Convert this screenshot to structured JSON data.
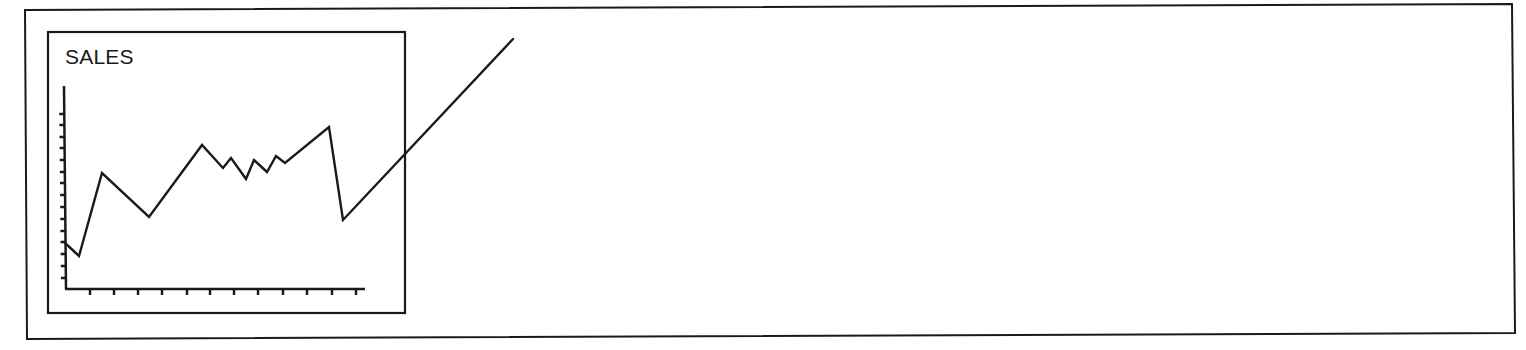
{
  "illustration": {
    "colors": {
      "ink": "#1a1a1a",
      "background": "#ffffff"
    },
    "outer_frame": {
      "corners": [
        [
          25,
          10
        ],
        [
          1512,
          4
        ],
        [
          1515,
          333
        ],
        [
          27,
          339
        ]
      ]
    },
    "inner_panel": {
      "x": 48,
      "y": 32,
      "x2": 405,
      "y2": 313
    },
    "axes": {
      "origin": [
        66,
        289
      ],
      "y_axis_top": [
        64,
        86
      ],
      "x_axis_end": [
        365,
        289
      ],
      "y_ticks_px": [
        114,
        125,
        137,
        148,
        160,
        172,
        183,
        195,
        207,
        219,
        231,
        242,
        254,
        266,
        278
      ],
      "x_ticks_px": [
        90,
        114,
        138,
        162,
        187,
        210,
        234,
        258,
        283,
        307,
        332,
        356
      ]
    },
    "line_points_px": [
      [
        65,
        243
      ],
      [
        79,
        256
      ],
      [
        102,
        173
      ],
      [
        149,
        217
      ],
      [
        202,
        145
      ],
      [
        223,
        168
      ],
      [
        231,
        158
      ],
      [
        246,
        179
      ],
      [
        254,
        160
      ],
      [
        267,
        172
      ],
      [
        276,
        156
      ],
      [
        285,
        163
      ],
      [
        329,
        127
      ],
      [
        343,
        220
      ],
      [
        513,
        39
      ]
    ]
  },
  "chart_data": {
    "type": "line",
    "title": "SALES",
    "xlabel": "",
    "ylabel": "",
    "x": [
      0,
      1,
      2,
      3,
      4,
      5,
      6,
      7,
      8,
      9,
      10,
      11,
      12,
      13,
      14
    ],
    "series": [
      {
        "name": "Sales",
        "values": [
          3.9,
          2.8,
          9.9,
          6.2,
          12.3,
          10.3,
          11.2,
          9.4,
          11.0,
          10.0,
          11.4,
          10.8,
          13.8,
          5.9,
          21.4
        ]
      }
    ],
    "y_tick_count": 15,
    "x_tick_count": 12,
    "tick_labels": "none",
    "ylim": [
      0,
      15
    ],
    "grid": false,
    "legend": "none",
    "annotations": [
      "Final segment rises steeply and extends beyond the chart panel border"
    ]
  }
}
